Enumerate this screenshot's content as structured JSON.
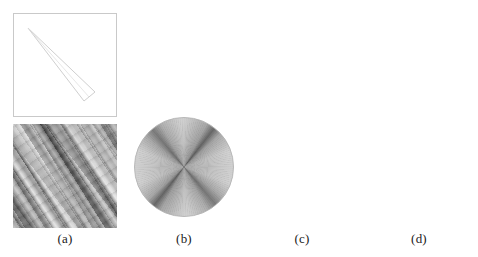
{
  "figure": {
    "background_color": "#ffffff",
    "columns": [
      {
        "id": "a",
        "label": "(a)",
        "kind": "input-images"
      },
      {
        "id": "b",
        "label": "(b)",
        "kind": "transform-disk"
      },
      {
        "id": "c",
        "label": "(c)",
        "kind": "transform-disk"
      },
      {
        "id": "d",
        "label": "(d)",
        "kind": "transform-disk"
      }
    ],
    "rows": [
      {
        "id": "top",
        "description": "thin elongated wedge input"
      },
      {
        "id": "bottom",
        "description": "anisotropic streak texture input"
      }
    ],
    "panels": {
      "a_top": {
        "name": "wedge-outline-image",
        "shape": "thin elongated wedge",
        "outline_color": "#d0d0d0",
        "background_color": "#ffffff",
        "frame_color": "#c9c9c9",
        "orientation_deg": -42
      },
      "a_bottom": {
        "name": "streak-texture-image",
        "base_gray": "#9a9a9a",
        "dark_gray": "#555555",
        "light_gray": "#cccccc",
        "streak_angle_deg": 56
      },
      "b_top": {
        "name": "gray-disk-x-cross",
        "disk_fill": "#d2d2d2",
        "ring_color": "#b8b8b8",
        "pattern": "dark X cross through center"
      },
      "b_bottom": {
        "name": "white-disk-pinwheel",
        "disk_fill": "#ffffff",
        "ring_color": "#b8b8b8",
        "pattern": "gray radiating fan sectors"
      },
      "c_top": {
        "name": "white-disk-black-bowtie",
        "disk_fill": "#ffffff",
        "ring_color": "#8f8f8f",
        "wedge_color": "#141414",
        "rim_tip_color": "#6b6b6b",
        "bowtie_angle_deg": 44
      },
      "c_bottom": {
        "name": "white-disk-black-bowtie",
        "disk_fill": "#ffffff",
        "ring_color": "#8f8f8f",
        "wedge_color": "#141414",
        "rim_tip_color": "#6b6b6b",
        "bowtie_angle_deg": 44
      },
      "d_top": {
        "name": "white-disk-thin-streak",
        "disk_fill": "#ffffff",
        "ring_color": "#8f8f8f",
        "streak_color": "#1e1e1e",
        "streak_angle_deg": -42
      },
      "d_bottom": {
        "name": "white-disk-faint-dots",
        "disk_fill": "#ffffff",
        "ring_color": "#4a4a4a",
        "dot_color": "#8c8c8c",
        "dot_angle_deg": -42
      }
    }
  }
}
